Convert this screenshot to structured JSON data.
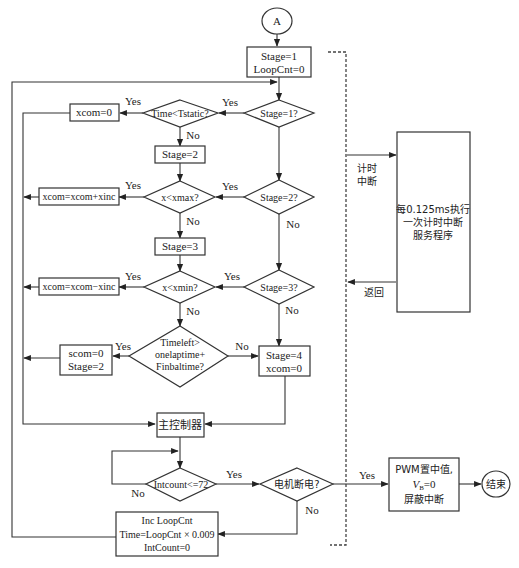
{
  "diagram": {
    "start_connector": "A",
    "init_box": [
      "Stage=1",
      "LoopCnt=0"
    ],
    "decisions": {
      "stage1": "Stage=1?",
      "stage2": "Stage=2?",
      "stage3": "Stage=3?",
      "time_tstatic": "Time<Tstatic?",
      "x_xmax": "x<xmax?",
      "x_xmin": "x<xmin?",
      "timeleft": [
        "Timeleft>",
        "onelaptime+",
        "Finbaltime?"
      ],
      "intcount": "Intcount<=72",
      "motor_off": "电机断电?"
    },
    "process": {
      "xcom0": "xcom=0",
      "stage2_set": "Stage=2",
      "xcom_plus": "xcom=xcom+xinc",
      "stage3_set": "Stage=3",
      "xcom_minus": "xcom=xcom−xinc",
      "scom_stage2": [
        "scom=0",
        "Stage=2"
      ],
      "stage4": [
        "Stage=4",
        "xcom=0"
      ],
      "main_controller": "主控制器",
      "loop_inc": [
        "Inc LoopCnt",
        "Time=LoopCnt × 0.009",
        "IntCount=0"
      ],
      "pwm_box": [
        "PWM置中值,",
        "V",
        "B",
        "=0",
        "屏蔽中断"
      ],
      "interrupt_service": [
        "每0.125ms执行",
        "一次计时中断",
        "服务程序"
      ]
    },
    "end_connector": "结束",
    "labels": {
      "yes": "Yes",
      "no": "No",
      "timer_interrupt": [
        "计时",
        "中断"
      ],
      "return": "返回"
    }
  }
}
